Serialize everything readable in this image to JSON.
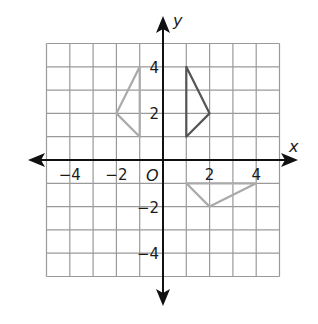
{
  "diagram": {
    "type": "coordinate-plane",
    "grid": {
      "xmin": -5,
      "xmax": 5,
      "ymin": -5,
      "ymax": 5,
      "step": 1
    },
    "axes": {
      "x_label": "x",
      "y_label": "y",
      "origin_label": "O"
    },
    "x_ticks": [
      {
        "value": -4,
        "label": "−4"
      },
      {
        "value": -2,
        "label": "−2"
      },
      {
        "value": 2,
        "label": "2"
      },
      {
        "value": 4,
        "label": "4"
      }
    ],
    "y_ticks": [
      {
        "value": 4,
        "label": "4"
      },
      {
        "value": 2,
        "label": "2"
      },
      {
        "value": -2,
        "label": "−2"
      },
      {
        "value": -4,
        "label": "−4"
      }
    ],
    "shapes": [
      {
        "name": "original-triangle",
        "color": "#555555",
        "points": [
          [
            1,
            4
          ],
          [
            2,
            2
          ],
          [
            1,
            1
          ]
        ]
      },
      {
        "name": "reflected-triangle-left",
        "color": "#aaaaaa",
        "points": [
          [
            -1,
            4
          ],
          [
            -2,
            2
          ],
          [
            -1,
            1
          ]
        ]
      },
      {
        "name": "rotated-triangle-bottom",
        "color": "#aaaaaa",
        "points": [
          [
            1,
            -1
          ],
          [
            2,
            -2
          ],
          [
            4,
            -1
          ]
        ]
      }
    ],
    "colors": {
      "grid": "#9a9a9a",
      "axis": "#111111"
    }
  }
}
